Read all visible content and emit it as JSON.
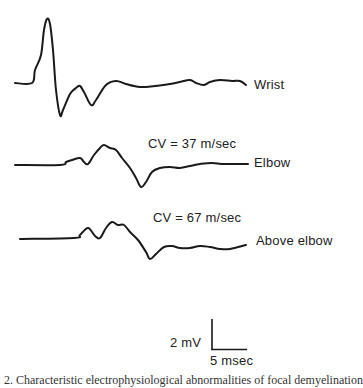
{
  "chart_data": {
    "type": "line",
    "title": "",
    "xlabel": "",
    "ylabel": "",
    "grid": false,
    "legend": "none",
    "series": [
      {
        "name": "Wrist",
        "label": "Wrist",
        "annotation": "",
        "baseline_y_px": 83,
        "points_px": [
          [
            15,
            83
          ],
          [
            32,
            83
          ],
          [
            35,
            70
          ],
          [
            41,
            55
          ],
          [
            44,
            30
          ],
          [
            47,
            19
          ],
          [
            50,
            24
          ],
          [
            53,
            50
          ],
          [
            56,
            90
          ],
          [
            60,
            115
          ],
          [
            63,
            110
          ],
          [
            70,
            94
          ],
          [
            76,
            88
          ],
          [
            80,
            86
          ],
          [
            84,
            92
          ],
          [
            91,
            105
          ],
          [
            96,
            100
          ],
          [
            106,
            85
          ],
          [
            116,
            81
          ],
          [
            126,
            84
          ],
          [
            140,
            87
          ],
          [
            155,
            86
          ],
          [
            170,
            84
          ],
          [
            180,
            82
          ],
          [
            190,
            80
          ],
          [
            196,
            83
          ],
          [
            204,
            85
          ],
          [
            210,
            82
          ],
          [
            220,
            80
          ],
          [
            232,
            81
          ],
          [
            240,
            81
          ],
          [
            246,
            85
          ]
        ]
      },
      {
        "name": "Elbow",
        "label": "Elbow",
        "annotation": "CV = 37 m/sec",
        "baseline_y_px": 165,
        "points_px": [
          [
            15,
            165
          ],
          [
            60,
            165
          ],
          [
            66,
            162
          ],
          [
            72,
            160
          ],
          [
            80,
            158
          ],
          [
            84,
            162
          ],
          [
            88,
            164
          ],
          [
            94,
            155
          ],
          [
            100,
            148
          ],
          [
            104,
            145
          ],
          [
            110,
            148
          ],
          [
            116,
            150
          ],
          [
            122,
            158
          ],
          [
            130,
            168
          ],
          [
            136,
            178
          ],
          [
            141,
            187
          ],
          [
            146,
            182
          ],
          [
            152,
            172
          ],
          [
            160,
            168
          ],
          [
            170,
            167
          ],
          [
            180,
            168
          ],
          [
            190,
            166
          ],
          [
            200,
            164
          ],
          [
            212,
            163
          ],
          [
            225,
            164
          ],
          [
            248,
            164
          ]
        ]
      },
      {
        "name": "Above elbow",
        "label": "Above elbow",
        "annotation": "CV = 67 m/sec",
        "baseline_y_px": 239,
        "points_px": [
          [
            20,
            239
          ],
          [
            74,
            238
          ],
          [
            80,
            235
          ],
          [
            88,
            228
          ],
          [
            95,
            236
          ],
          [
            100,
            238
          ],
          [
            106,
            228
          ],
          [
            112,
            222
          ],
          [
            118,
            225
          ],
          [
            124,
            225
          ],
          [
            130,
            232
          ],
          [
            138,
            240
          ],
          [
            146,
            252
          ],
          [
            150,
            259
          ],
          [
            156,
            254
          ],
          [
            164,
            247
          ],
          [
            172,
            246
          ],
          [
            180,
            248
          ],
          [
            190,
            248
          ],
          [
            200,
            246
          ],
          [
            210,
            247
          ],
          [
            220,
            249
          ],
          [
            230,
            249
          ],
          [
            246,
            245
          ]
        ]
      }
    ],
    "scale_bar": {
      "vertical": {
        "value": 2,
        "unit": "mV",
        "label": "2 mV"
      },
      "horizontal": {
        "value": 5,
        "unit": "msec",
        "label": "5 msec"
      }
    },
    "caption": "Characteristic electrophysiological abnormalities of focal demyelination"
  },
  "labels": {
    "wrist": "Wrist",
    "elbow": "Elbow",
    "above_elbow": "Above elbow",
    "cv_elbow": "CV = 37 m/sec",
    "cv_above_elbow": "CV = 67 m/sec",
    "scale_voltage": "2 mV",
    "scale_time": "5 msec",
    "caption": "2. Characteristic electrophysiological abnormalities of focal demyelination"
  },
  "colors": {
    "trace": "#1a1a1a",
    "background": "#ffffff"
  }
}
